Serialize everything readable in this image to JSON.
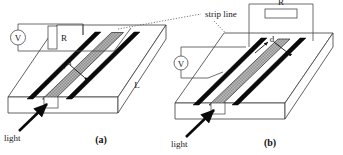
{
  "figure": {
    "type": "schematic-diagram",
    "annotation": {
      "strip_line_label": "strip line",
      "light_label_a": "light",
      "light_label_b": "light"
    },
    "panels": [
      {
        "id": "a",
        "caption": "(a)",
        "circuit": {
          "voltmeter_symbol": "V",
          "resistor_label": "R",
          "resistor_orientation": "vertical"
        },
        "dimensions": {
          "gap_label": "d",
          "length_label": "L"
        },
        "light_label": "light",
        "strip_count": 2
      },
      {
        "id": "b",
        "caption": "(b)",
        "circuit": {
          "voltmeter_symbol": "V",
          "resistor_label": "R",
          "resistor_orientation": "horizontal"
        },
        "dimensions": {
          "gap_label": "d"
        },
        "light_label": "light",
        "strip_count": 2
      }
    ],
    "colors": {
      "strip_line": "#0a0a0a",
      "substrate_outline": "#3a3a3a",
      "gap_fill": "#b6b6b6",
      "background": "#ffffff",
      "wire": "#4a4a4a"
    }
  }
}
